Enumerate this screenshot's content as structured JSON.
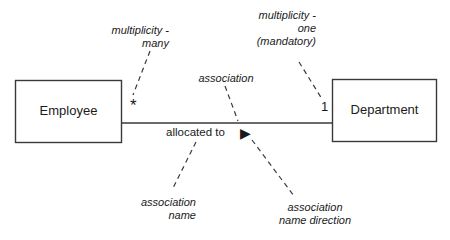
{
  "diagram": {
    "type": "uml-class-association-diagram",
    "background_color": "#ffffff",
    "line_color": "#3a3a3a",
    "text_color": "#1a1a1a",
    "classes": [
      {
        "id": "employee",
        "name": "Employee"
      },
      {
        "id": "department",
        "name": "Department"
      }
    ],
    "association": {
      "name": "allocated to",
      "direction_marker": "▶",
      "source_multiplicity": "*",
      "target_multiplicity": "1"
    },
    "annotations": {
      "multiplicity_many": "multiplicity -\nmany",
      "multiplicity_one": "multiplicity -\none\n(mandatory)",
      "association": "association",
      "association_name": "association\nname",
      "association_name_direction": "association\nname direction"
    }
  }
}
